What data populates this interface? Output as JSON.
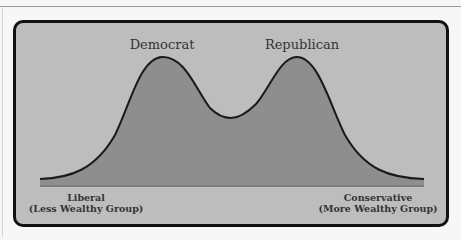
{
  "diagram": {
    "type": "bimodal-distribution",
    "peaks": [
      {
        "label": "Democrat",
        "x": 162
      },
      {
        "label": "Republican",
        "x": 297
      }
    ],
    "axis": {
      "left": {
        "line1": "Liberal",
        "line2": "(Less Wealthy Group)"
      },
      "right": {
        "line1": "Conservative",
        "line2": "(More Wealthy Group)"
      }
    },
    "colors": {
      "background": "#bdbdbd",
      "fill": "#8e8e8e",
      "stroke": "#1a1a1a",
      "frame": "#111111"
    }
  }
}
